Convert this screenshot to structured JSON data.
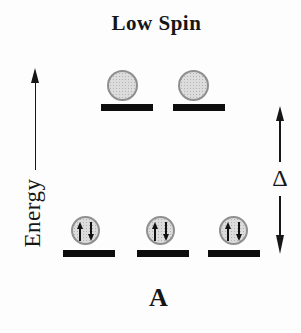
{
  "figure": {
    "title": "Low Spin",
    "bottom_label": "A",
    "energy_axis": {
      "label": "Energy",
      "icon": "up-arrow-icon"
    },
    "gap_indicator": {
      "label": "Δ",
      "icons": [
        "up-arrow-icon",
        "down-arrow-icon"
      ]
    },
    "levels": {
      "upper": {
        "orbitals": 2,
        "electrons_per_orbital": 0
      },
      "lower": {
        "orbitals": 3,
        "electrons_per_orbital": 2,
        "spins": [
          "up",
          "down"
        ]
      }
    },
    "colors": {
      "ink": "#161616",
      "orbital_fill": "#dcdcdc",
      "orbital_border": "#8f8f8f",
      "level_bar": "#0d0d0d",
      "background": "#fdfdfd"
    }
  }
}
